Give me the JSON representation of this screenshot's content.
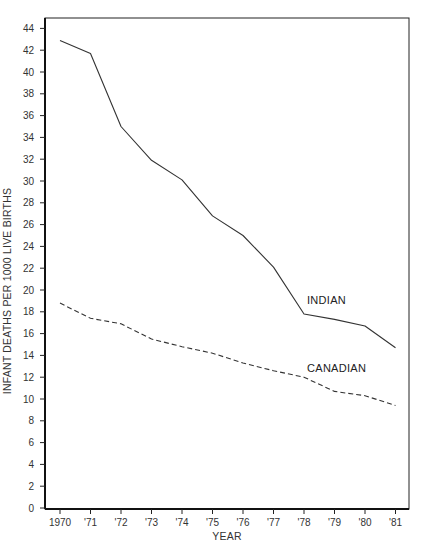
{
  "chart_data": {
    "type": "line",
    "title": "",
    "xlabel": "YEAR",
    "ylabel": "INFANT DEATHS PER 1000 LIVE BIRTHS",
    "categories": [
      "1970",
      "'71",
      "'72",
      "'73",
      "'74",
      "'75",
      "'76",
      "'77",
      "'78",
      "'79",
      "'80",
      "'81"
    ],
    "yticks": [
      0,
      2,
      4,
      6,
      8,
      10,
      12,
      14,
      16,
      18,
      20,
      22,
      24,
      26,
      28,
      30,
      32,
      34,
      36,
      38,
      40,
      42,
      44
    ],
    "ylim": [
      0,
      45
    ],
    "grid": false,
    "legend": "inline labels",
    "series": [
      {
        "name": "INDIAN",
        "style": "solid",
        "values": [
          42.9,
          41.7,
          35.0,
          31.9,
          30.1,
          26.8,
          25.0,
          22.1,
          17.8,
          17.3,
          16.7,
          14.7
        ],
        "label_at": {
          "x_index": 8,
          "y": 18.7
        }
      },
      {
        "name": "CANADIAN",
        "style": "dashed",
        "values": [
          18.8,
          17.4,
          16.9,
          15.5,
          14.8,
          14.2,
          13.3,
          12.6,
          12.0,
          10.7,
          10.3,
          9.4
        ],
        "label_at": {
          "x_index": 8,
          "y": 12.5
        }
      }
    ]
  },
  "colors": {
    "line": "#333333",
    "axis": "#111111",
    "text": "#333333"
  }
}
